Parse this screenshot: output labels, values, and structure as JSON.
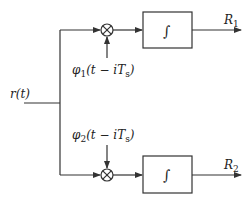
{
  "diagram": {
    "input_label": "r(t)",
    "branches": [
      {
        "basis_label_main": "φ",
        "basis_sub": "1",
        "basis_arg": "(t − iT",
        "basis_arg_sub": "s",
        "basis_close": ")",
        "block_symbol": "∫",
        "output_main": "R",
        "output_sub": "1"
      },
      {
        "basis_label_main": "φ",
        "basis_sub": "2",
        "basis_arg": "(t − iT",
        "basis_arg_sub": "s",
        "basis_close": ")",
        "block_symbol": "∫",
        "output_main": "R",
        "output_sub": "2"
      }
    ],
    "colors": {
      "stroke": "#333333",
      "background": "#ffffff"
    }
  }
}
